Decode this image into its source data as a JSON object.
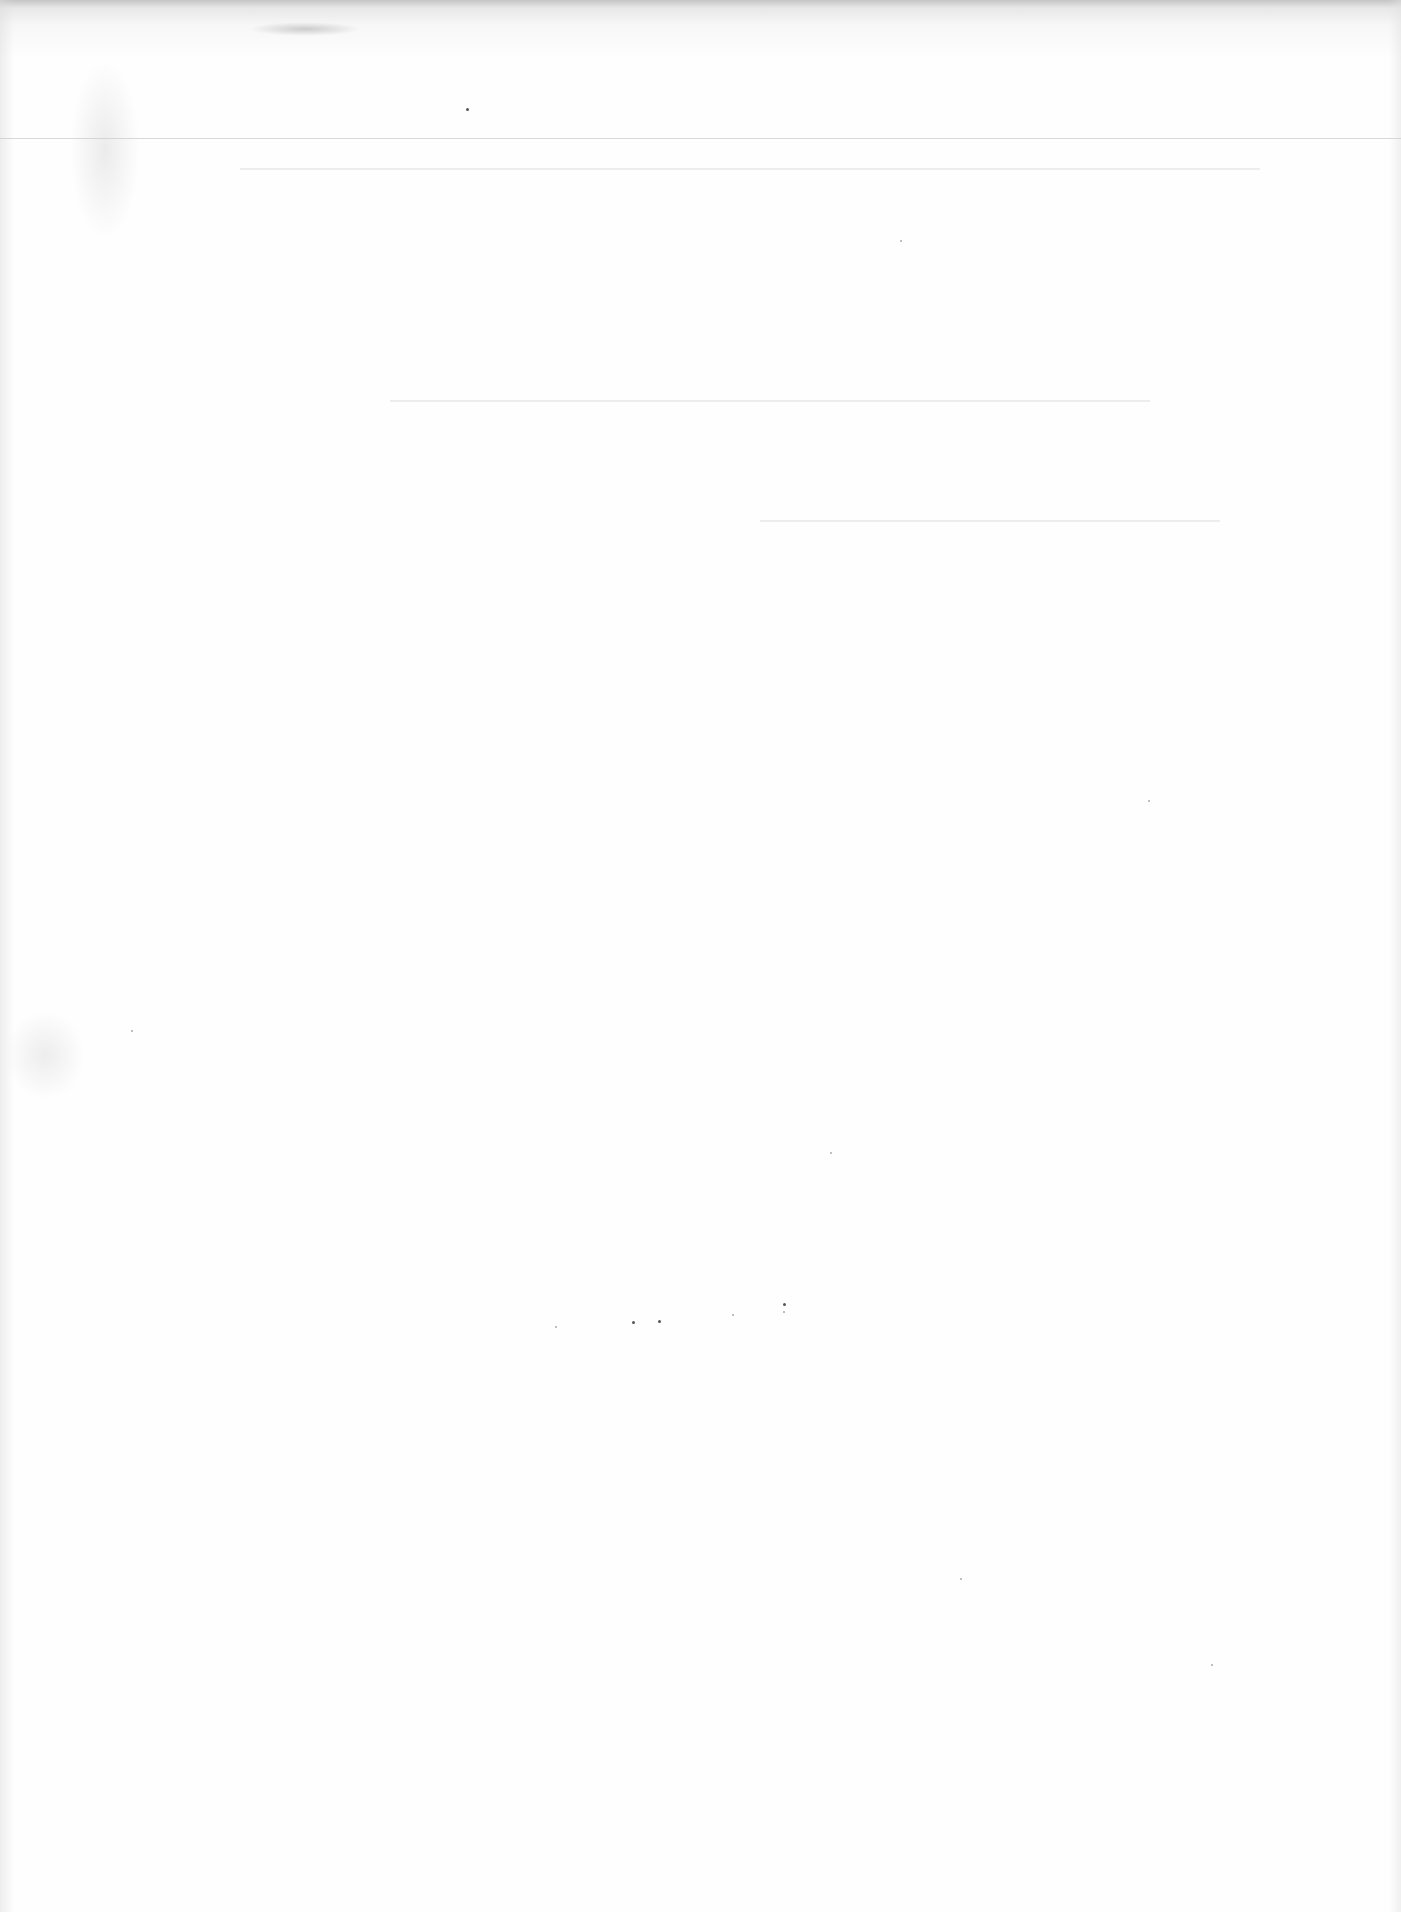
{
  "document": {
    "type": "scanned-page",
    "content": "",
    "background_color": "#fefefe",
    "notes_visible": []
  }
}
